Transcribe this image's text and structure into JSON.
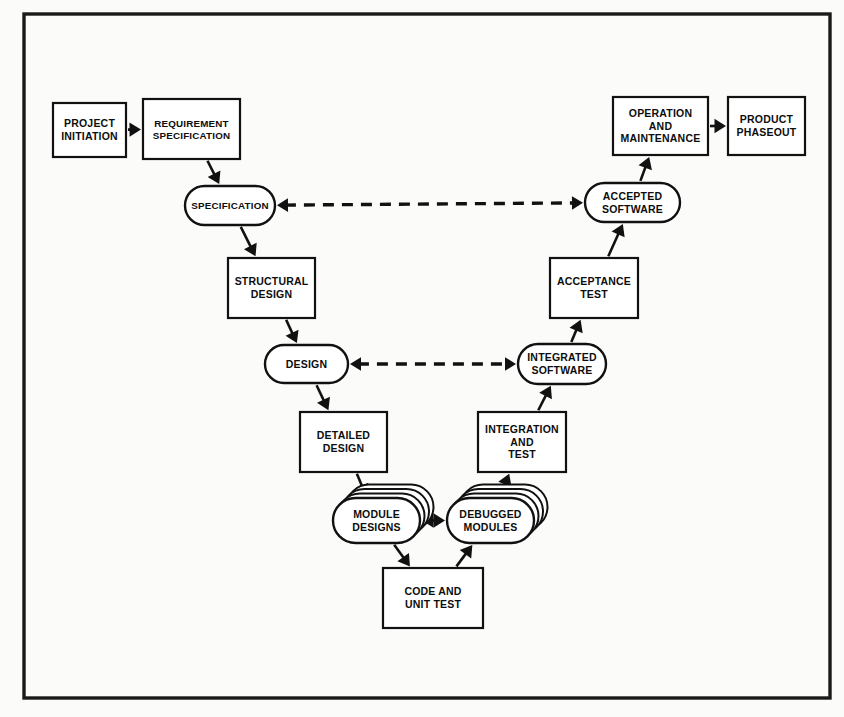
{
  "diagram": {
    "frame": {
      "stroke_color": "#1a1a1a"
    },
    "background_color": "#fbfbf9",
    "line_color": "#111111",
    "node_fill": "#ffffff",
    "nodes": [
      {
        "id": "project_initiation",
        "label": "PROJECT\nINITIATION",
        "shape": "box",
        "x": 53,
        "y": 103,
        "w": 73,
        "h": 54
      },
      {
        "id": "requirement_spec",
        "label": "REQUIREMENT\nSPECIFICATION",
        "shape": "box",
        "x": 143,
        "y": 99,
        "w": 97,
        "h": 60
      },
      {
        "id": "specification",
        "label": "SPECIFICATION",
        "shape": "stadium",
        "x": 185,
        "y": 186,
        "w": 90,
        "h": 39
      },
      {
        "id": "structural_design",
        "label": "STRUCTURAL\nDESIGN",
        "shape": "box",
        "x": 228,
        "y": 258,
        "w": 87,
        "h": 60
      },
      {
        "id": "design",
        "label": "DESIGN",
        "shape": "stadium",
        "x": 265,
        "y": 345,
        "w": 83,
        "h": 38
      },
      {
        "id": "detailed_design",
        "label": "DETAILED\nDESIGN",
        "shape": "box",
        "x": 300,
        "y": 412,
        "w": 87,
        "h": 60
      },
      {
        "id": "module_designs",
        "label": "MODULE\nDESIGNS",
        "shape": "stack",
        "x": 333,
        "y": 498,
        "w": 87,
        "h": 45
      },
      {
        "id": "code_unit_test",
        "label": "CODE AND\nUNIT TEST",
        "shape": "box",
        "x": 383,
        "y": 568,
        "w": 100,
        "h": 60
      },
      {
        "id": "debugged_modules",
        "label": "DEBUGGED\nMODULES",
        "shape": "stack",
        "x": 447,
        "y": 498,
        "w": 87,
        "h": 45
      },
      {
        "id": "integration_and_test",
        "label": "INTEGRATION\nAND\nTEST",
        "shape": "box",
        "x": 478,
        "y": 412,
        "w": 88,
        "h": 60
      },
      {
        "id": "integrated_software",
        "label": "INTEGRATED\nSOFTWARE",
        "shape": "stadium",
        "x": 518,
        "y": 344,
        "w": 88,
        "h": 40
      },
      {
        "id": "acceptance_test",
        "label": "ACCEPTANCE\nTEST",
        "shape": "box",
        "x": 550,
        "y": 258,
        "w": 88,
        "h": 60
      },
      {
        "id": "accepted_software",
        "label": "ACCEPTED\nSOFTWARE",
        "shape": "stadium",
        "x": 585,
        "y": 183,
        "w": 95,
        "h": 39
      },
      {
        "id": "operation_maintenance",
        "label": "OPERATION\nAND\nMAINTENANCE",
        "shape": "box",
        "x": 613,
        "y": 97,
        "w": 95,
        "h": 58
      },
      {
        "id": "product_phaseout",
        "label": "PRODUCT\nPHASEOUT",
        "shape": "box",
        "x": 728,
        "y": 97,
        "w": 77,
        "h": 58
      }
    ],
    "edges": [
      {
        "id": "e1",
        "from": "project_initiation",
        "to": "requirement_spec",
        "style": "solid",
        "direction": "forward"
      },
      {
        "id": "e2",
        "from": "requirement_spec",
        "to": "specification",
        "style": "solid",
        "direction": "forward"
      },
      {
        "id": "e3",
        "from": "specification",
        "to": "structural_design",
        "style": "solid",
        "direction": "forward"
      },
      {
        "id": "e4",
        "from": "structural_design",
        "to": "design",
        "style": "solid",
        "direction": "forward"
      },
      {
        "id": "e5",
        "from": "design",
        "to": "detailed_design",
        "style": "solid",
        "direction": "forward"
      },
      {
        "id": "e6",
        "from": "detailed_design",
        "to": "module_designs",
        "style": "solid",
        "direction": "forward"
      },
      {
        "id": "e7",
        "from": "module_designs",
        "to": "code_unit_test",
        "style": "solid",
        "direction": "forward"
      },
      {
        "id": "e8",
        "from": "code_unit_test",
        "to": "debugged_modules",
        "style": "solid",
        "direction": "forward"
      },
      {
        "id": "e9",
        "from": "debugged_modules",
        "to": "integration_and_test",
        "style": "solid",
        "direction": "forward"
      },
      {
        "id": "e10",
        "from": "integration_and_test",
        "to": "integrated_software",
        "style": "solid",
        "direction": "forward"
      },
      {
        "id": "e11",
        "from": "integrated_software",
        "to": "acceptance_test",
        "style": "solid",
        "direction": "forward"
      },
      {
        "id": "e12",
        "from": "acceptance_test",
        "to": "accepted_software",
        "style": "solid",
        "direction": "forward"
      },
      {
        "id": "e13",
        "from": "accepted_software",
        "to": "operation_maintenance",
        "style": "solid",
        "direction": "forward"
      },
      {
        "id": "e14",
        "from": "operation_maintenance",
        "to": "product_phaseout",
        "style": "solid",
        "direction": "forward"
      },
      {
        "id": "e15",
        "from": "specification",
        "to": "accepted_software",
        "style": "dashed",
        "direction": "both"
      },
      {
        "id": "e16",
        "from": "design",
        "to": "integrated_software",
        "style": "dashed",
        "direction": "both"
      },
      {
        "id": "e17",
        "from": "module_designs",
        "to": "debugged_modules",
        "style": "solid",
        "direction": "both"
      }
    ]
  }
}
